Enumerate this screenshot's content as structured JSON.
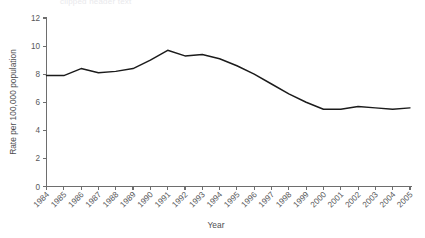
{
  "chart_data": {
    "type": "line",
    "title": "",
    "xlabel": "Year",
    "ylabel": "Rate per 100,000 population",
    "categories": [
      "1984",
      "1985",
      "1986",
      "1987",
      "1988",
      "1989",
      "1990",
      "1991",
      "1992",
      "1993",
      "1994",
      "1995",
      "1996",
      "1997",
      "1998",
      "1999",
      "2000",
      "2001",
      "2002",
      "2003",
      "2004",
      "2005"
    ],
    "values": [
      7.9,
      7.9,
      8.4,
      8.1,
      8.2,
      8.4,
      9.0,
      9.7,
      9.3,
      9.4,
      9.1,
      8.6,
      8.0,
      7.3,
      6.6,
      6.0,
      5.5,
      5.5,
      5.7,
      5.6,
      5.5,
      5.6
    ],
    "series": [
      {
        "name": "Rate",
        "values": [
          7.9,
          7.9,
          8.4,
          8.1,
          8.2,
          8.4,
          9.0,
          9.7,
          9.3,
          9.4,
          9.1,
          8.6,
          8.0,
          7.3,
          6.6,
          6.0,
          5.5,
          5.5,
          5.7,
          5.6,
          5.5,
          5.6
        ],
        "color": "#1b1b1b"
      }
    ],
    "ylim": [
      0,
      12
    ],
    "yticks": [
      0,
      2,
      4,
      6,
      8,
      10,
      12
    ],
    "ytick_labels": [
      "0",
      "2",
      "4",
      "6",
      "8",
      "10",
      "12"
    ],
    "grid": false,
    "legend": "none",
    "xtick_rotation": -45
  },
  "top_strip": {
    "text": "clipped header text"
  }
}
